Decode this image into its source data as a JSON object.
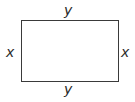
{
  "diagram": {
    "shape": "rectangle",
    "labels": {
      "top": "y",
      "bottom": "y",
      "left": "x",
      "right": "x"
    },
    "stroke_color": "#3a3a3a"
  }
}
